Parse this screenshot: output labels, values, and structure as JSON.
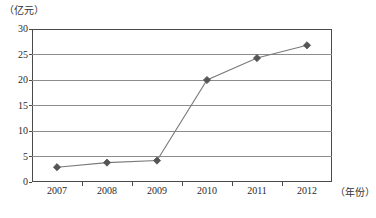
{
  "chart_data": {
    "type": "line",
    "title": "",
    "xlabel": "（年份）",
    "ylabel": "（亿元）",
    "categories": [
      "2007",
      "2008",
      "2009",
      "2010",
      "2011",
      "2012"
    ],
    "values": [
      2.9,
      3.8,
      4.2,
      20.0,
      24.3,
      26.8
    ],
    "series": [
      {
        "name": "",
        "values": [
          2.9,
          3.8,
          4.2,
          20.0,
          24.3,
          26.8
        ]
      }
    ],
    "ylim": [
      0,
      30
    ],
    "ytick_labels": [
      "0",
      "5",
      "10",
      "15",
      "20",
      "25",
      "30"
    ],
    "ytick_values": [
      0,
      5,
      10,
      15,
      20,
      25,
      30
    ],
    "grid": "horizontal",
    "legend": "none",
    "marker": "diamond",
    "line_color": "#7a7a7a",
    "marker_color": "#555555",
    "grid_color": "#8c8c8c",
    "frame_color": "#4a4a4a"
  }
}
